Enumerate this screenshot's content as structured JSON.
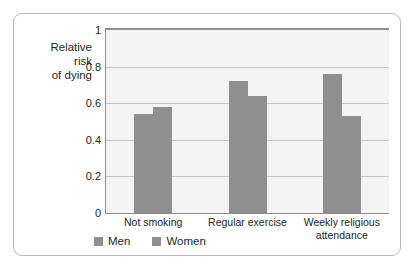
{
  "chart_data": {
    "type": "bar",
    "title": "",
    "xlabel": "",
    "ylabel": "Relative risk of dying",
    "ylabel_lines": [
      "Relative",
      "risk",
      "of dying"
    ],
    "categories": [
      "Not smoking",
      "Regular exercise",
      "Weekly religious attendance"
    ],
    "category_lines": [
      [
        "Not smoking"
      ],
      [
        "Regular exercise"
      ],
      [
        "Weekly religious",
        "attendance"
      ]
    ],
    "series": [
      {
        "name": "Men",
        "values": [
          0.54,
          0.72,
          0.76
        ]
      },
      {
        "name": "Women",
        "values": [
          0.58,
          0.64,
          0.53
        ]
      }
    ],
    "ylim": [
      0,
      1
    ],
    "y_ticks": [
      0,
      0.2,
      0.4,
      0.6,
      0.8,
      1
    ],
    "y_tick_labels": [
      "0",
      "0.2",
      "0.4",
      "0.6",
      "0.8",
      "1"
    ],
    "grid": true,
    "legend_position": "bottom-left",
    "legend": [
      "Men",
      "Women"
    ],
    "colors": {
      "bar_men": "#8f8f8f",
      "bar_women": "#8f8f8f",
      "plot_background": "#f4f4f4",
      "gridline": "#c5c5c5",
      "axis": "#8d8d8d",
      "card_border": "#b9b9b9",
      "text": "#231f20",
      "page_background": "#ffffff"
    }
  }
}
